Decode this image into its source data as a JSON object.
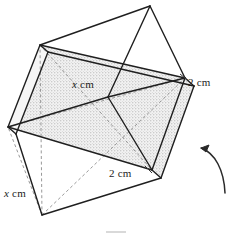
{
  "figure": {
    "name": "square-bipyramid-with-shaded-cross-section",
    "background_color": "#ffffff",
    "line_color": "#1c1c1c",
    "hidden_line_color": "#8b8b8b",
    "shade_fill_color": "#efefef",
    "stipple_color": "#9a9a9a"
  },
  "labels": {
    "x_top": {
      "var": "x",
      "unit": " cm"
    },
    "x_bottom": {
      "var": "x",
      "unit": " cm"
    },
    "edge_right": {
      "var": "2",
      "unit": " cm"
    },
    "edge_bottom": {
      "var": "2",
      "unit": " cm"
    }
  },
  "annotations": {
    "rotation_arrow": "curved-rotation-arrow"
  }
}
